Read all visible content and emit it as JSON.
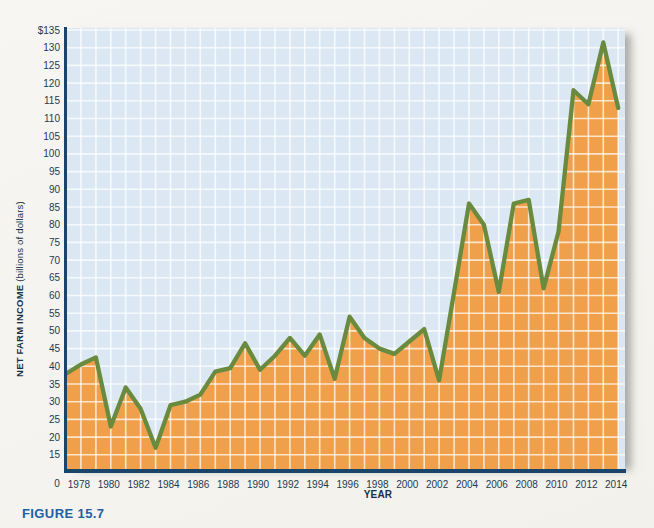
{
  "figure": {
    "caption": "FIGURE 15.7"
  },
  "chart_data": {
    "type": "area",
    "title": "",
    "xlabel": "YEAR",
    "ylabel_bold": "NET FARM INCOME",
    "ylabel_regular": " (billions of dollars)",
    "origin_label": "0",
    "x": [
      1978,
      1979,
      1980,
      1981,
      1982,
      1983,
      1984,
      1985,
      1986,
      1987,
      1988,
      1989,
      1990,
      1991,
      1992,
      1993,
      1994,
      1995,
      1996,
      1997,
      1998,
      1999,
      2000,
      2001,
      2002,
      2003,
      2004,
      2005,
      2006,
      2007,
      2008,
      2009,
      2010,
      2011,
      2012,
      2013,
      2014
    ],
    "values": [
      40.5,
      42.5,
      23,
      34,
      28,
      17,
      29,
      30,
      32,
      38.5,
      39.5,
      46.5,
      39,
      43,
      48,
      43,
      49,
      36.5,
      54,
      48,
      45,
      43.5,
      47,
      50.5,
      36,
      61,
      86,
      80,
      61,
      86,
      87,
      62,
      78,
      118,
      114,
      131.5,
      113
    ],
    "axis_edge_value": 38,
    "y_tick_labels": [
      "$135",
      "130",
      "125",
      "120",
      "115",
      "110",
      "105",
      "100",
      "95",
      "90",
      "85",
      "80",
      "75",
      "70",
      "65",
      "60",
      "55",
      "50",
      "45",
      "40",
      "35",
      "30",
      "25",
      "20",
      "15"
    ],
    "x_tick_labels": [
      "1978",
      "1980",
      "1982",
      "1984",
      "1986",
      "1988",
      "1990",
      "1992",
      "1994",
      "1996",
      "1998",
      "2000",
      "2002",
      "2004",
      "2006",
      "2008",
      "2010",
      "2012",
      "2014"
    ],
    "ylim": [
      10.7,
      135.6
    ],
    "grid": "on",
    "legend": "none",
    "colors": {
      "area_fill": "#f0a04b",
      "line": "#6a8a3e",
      "plot_background": "#dbe8f4",
      "gridline": "#ffffff",
      "axis": "#1a4469",
      "tick_label": "#1e3a52",
      "caption": "#2160a4"
    }
  }
}
